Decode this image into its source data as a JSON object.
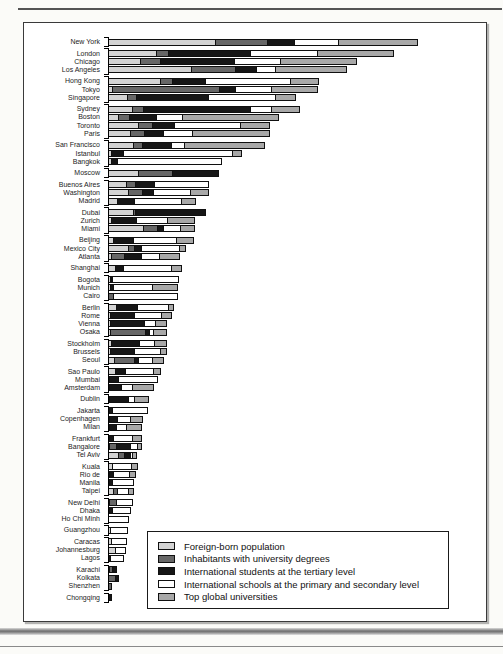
{
  "figure": {
    "title": "",
    "frame_border_color": "#3a3a3a",
    "background": "#ffffff"
  },
  "chart_data": {
    "type": "bar",
    "orientation": "horizontal",
    "stacked": true,
    "grid": false,
    "value_axis_visible": false,
    "value_unit": "relative index (no numeric axis shown; values estimated from bar lengths)",
    "legend_position": "inside bottom-right",
    "series": [
      {
        "name": "Foreign-born population",
        "color": "#d3d3d3"
      },
      {
        "name": "Inhabitants with university degrees",
        "color": "#676767"
      },
      {
        "name": "International students at the tertiary level",
        "color": "#161616"
      },
      {
        "name": "International schools at the primary and secondary level",
        "color": "#ffffff"
      },
      {
        "name": "Top global universities",
        "color": "#a8a8a8"
      }
    ],
    "groups": [
      {
        "cities": [
          {
            "name": "New York",
            "values": [
              108,
              53,
              28,
              45,
              80
            ]
          }
        ]
      },
      {
        "cities": [
          {
            "name": "London",
            "values": [
              49,
              13,
              83,
              68,
              77
            ]
          },
          {
            "name": "Chicago",
            "values": [
              33,
              21,
              75,
              47,
              77
            ]
          },
          {
            "name": "Los Angeles",
            "values": [
              84,
              45,
              22,
              20,
              72
            ]
          }
        ]
      },
      {
        "cities": [
          {
            "name": "Hong Kong",
            "values": [
              53,
              13,
              34,
              86,
              29
            ]
          },
          {
            "name": "Tokyo",
            "values": [
              5,
              108,
              17,
              37,
              47
            ]
          },
          {
            "name": "Singapore",
            "values": [
              20,
              10,
              73,
              68,
              21
            ]
          }
        ]
      },
      {
        "cities": [
          {
            "name": "Sydney",
            "values": [
              25,
              12,
              108,
              22,
              29
            ]
          },
          {
            "name": "Boston",
            "values": [
              11,
              12,
              28,
              27,
              97
            ]
          },
          {
            "name": "Toronto",
            "values": [
              31,
              15,
              23,
              67,
              30
            ]
          },
          {
            "name": "Paris",
            "values": [
              23,
              15,
              20,
              30,
              78
            ]
          }
        ]
      },
      {
        "cities": [
          {
            "name": "San Francisco",
            "values": [
              26,
              10,
              30,
              14,
              81
            ]
          },
          {
            "name": "Istanbul",
            "values": [
              4,
              0,
              13,
              110,
              10
            ]
          },
          {
            "name": "Bangkok",
            "values": [
              4,
              0,
              7,
              105,
              0
            ]
          }
        ]
      },
      {
        "cities": [
          {
            "name": "Moscow",
            "values": [
              31,
              35,
              47,
              0,
              0
            ]
          }
        ]
      },
      {
        "cities": [
          {
            "name": "Buenos Aires",
            "values": [
              19,
              10,
              20,
              55,
              0
            ]
          },
          {
            "name": "Washington",
            "values": [
              21,
              15,
              12,
              38,
              19
            ]
          },
          {
            "name": "Madrid",
            "values": [
              10,
              0,
              18,
              48,
              15
            ]
          }
        ]
      },
      {
        "cities": [
          {
            "name": "Dubai",
            "values": [
              26,
              3,
              71,
              0,
              0
            ]
          },
          {
            "name": "Zurich",
            "values": [
              4,
              0,
              26,
              32,
              28
            ]
          },
          {
            "name": "Miami",
            "values": [
              36,
              15,
              7,
              18,
              15
            ]
          }
        ]
      },
      {
        "cities": [
          {
            "name": "Beijing",
            "values": [
              6,
              0,
              21,
              44,
              18
            ]
          },
          {
            "name": "Mexico City",
            "values": [
              21,
              7,
              8,
              39,
              7
            ]
          },
          {
            "name": "Atlanta",
            "values": [
              4,
              14,
              18,
              19,
              21
            ]
          }
        ]
      },
      {
        "cities": [
          {
            "name": "Shanghai",
            "values": [
              8,
              0,
              9,
              49,
              11
            ]
          }
        ]
      },
      {
        "cities": [
          {
            "name": "Bogota",
            "values": [
              3,
              1,
              1,
              67,
              0
            ]
          },
          {
            "name": "Munich",
            "values": [
              3,
              0,
              4,
              40,
              26
            ]
          },
          {
            "name": "Cairo",
            "values": [
              0,
              6,
              0,
              65,
              0
            ]
          }
        ]
      },
      {
        "cities": [
          {
            "name": "Berlin",
            "values": [
              9,
              0,
              22,
              32,
              6
            ]
          },
          {
            "name": "Rome",
            "values": [
              3,
              0,
              25,
              28,
              11
            ]
          },
          {
            "name": "Vienna",
            "values": [
              3,
              0,
              35,
              12,
              12
            ]
          },
          {
            "name": "Osaka",
            "values": [
              3,
              36,
              5,
              5,
              14
            ]
          }
        ]
      },
      {
        "cities": [
          {
            "name": "Stockholm",
            "values": [
              4,
              0,
              29,
              16,
              13
            ]
          },
          {
            "name": "Brussels",
            "values": [
              3,
              0,
              25,
              27,
              7
            ]
          },
          {
            "name": "Seoul",
            "values": [
              7,
              21,
              5,
              15,
              12
            ]
          }
        ]
      },
      {
        "cities": [
          {
            "name": "Sao Paulo",
            "values": [
              8,
              0,
              11,
              29,
              8
            ]
          },
          {
            "name": "Mumbai",
            "values": [
              2,
              0,
              10,
              40,
              0
            ]
          },
          {
            "name": "Amsterdam",
            "values": [
              2,
              0,
              13,
              12,
              22
            ]
          }
        ]
      },
      {
        "cities": [
          {
            "name": "Dublin",
            "values": [
              2,
              0,
              20,
              7,
              15
            ]
          }
        ]
      },
      {
        "cities": [
          {
            "name": "Jakarta",
            "values": [
              2,
              0,
              4,
              36,
              0
            ]
          },
          {
            "name": "Copenhagen",
            "values": [
              2,
              0,
              9,
              14,
              13
            ]
          },
          {
            "name": "Milan",
            "values": [
              2,
              0,
              8,
              11,
              16
            ]
          }
        ]
      },
      {
        "cities": [
          {
            "name": "Frankfurt",
            "values": [
              2,
              0,
              5,
              20,
              10
            ]
          },
          {
            "name": "Bangalore",
            "values": [
              2,
              8,
              15,
              8,
              5
            ]
          },
          {
            "name": "Tel Aviv",
            "values": [
              11,
              7,
              7,
              3,
              5
            ]
          }
        ]
      },
      {
        "cities": [
          {
            "name": "Kuala",
            "values": [
              5,
              0,
              0,
              20,
              7
            ]
          },
          {
            "name": "Rio de",
            "values": [
              2,
              0,
              5,
              17,
              7
            ]
          },
          {
            "name": "Manila",
            "values": [
              2,
              0,
              4,
              22,
              0
            ]
          },
          {
            "name": "Taipei",
            "values": [
              6,
              5,
              0,
              12,
              6
            ]
          }
        ]
      },
      {
        "cities": [
          {
            "name": "New Delhi",
            "values": [
              2,
              8,
              0,
              17,
              0
            ]
          },
          {
            "name": "Dhaka",
            "values": [
              1,
              0,
              4,
              19,
              0
            ]
          },
          {
            "name": "Ho Chi Minh",
            "values": [
              0,
              0,
              0,
              21,
              0
            ]
          }
        ]
      },
      {
        "cities": [
          {
            "name": "Guangzhou",
            "values": [
              3,
              0,
              0,
              18,
              0
            ]
          }
        ]
      },
      {
        "cities": [
          {
            "name": "Caracas",
            "values": [
              4,
              0,
              0,
              16,
              0
            ]
          },
          {
            "name": "Johannesburg",
            "values": [
              8,
              0,
              0,
              11,
              0
            ]
          },
          {
            "name": "Lagos",
            "values": [
              0,
              0,
              3,
              14,
              0
            ]
          }
        ]
      },
      {
        "cities": [
          {
            "name": "Karachi",
            "values": [
              2,
              4,
              5,
              0,
              0
            ]
          },
          {
            "name": "Kolkata",
            "values": [
              0,
              8,
              4,
              0,
              0
            ]
          },
          {
            "name": "Shenzhen",
            "values": [
              0,
              4,
              0,
              0,
              0
            ]
          }
        ]
      },
      {
        "cities": [
          {
            "name": "Chongqing",
            "values": [
              0,
              0,
              4,
              0,
              0
            ]
          }
        ]
      }
    ]
  }
}
